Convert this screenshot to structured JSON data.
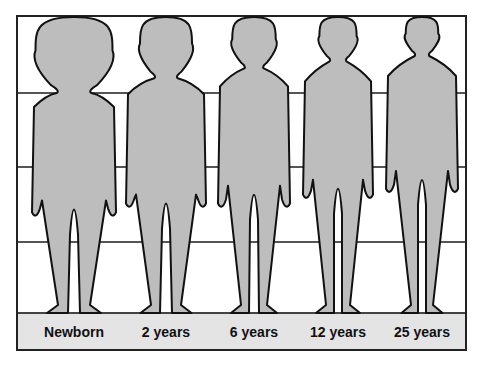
{
  "diagram": {
    "title": "",
    "figure_fill": "#bdbdbd",
    "outline_color": "#111111",
    "grid_line_color": "#555555",
    "label_bar_color": "#e4e4e4",
    "figures": [
      {
        "label": "Newborn",
        "cx": 74,
        "head_h": 0.25
      },
      {
        "label": "2 years",
        "cx": 166,
        "head_h": 0.2
      },
      {
        "label": "6 years",
        "cx": 254,
        "head_h": 0.167
      },
      {
        "label": "12 years",
        "cx": 338,
        "head_h": 0.143
      },
      {
        "label": "25 years",
        "cx": 422,
        "head_h": 0.125
      }
    ]
  }
}
